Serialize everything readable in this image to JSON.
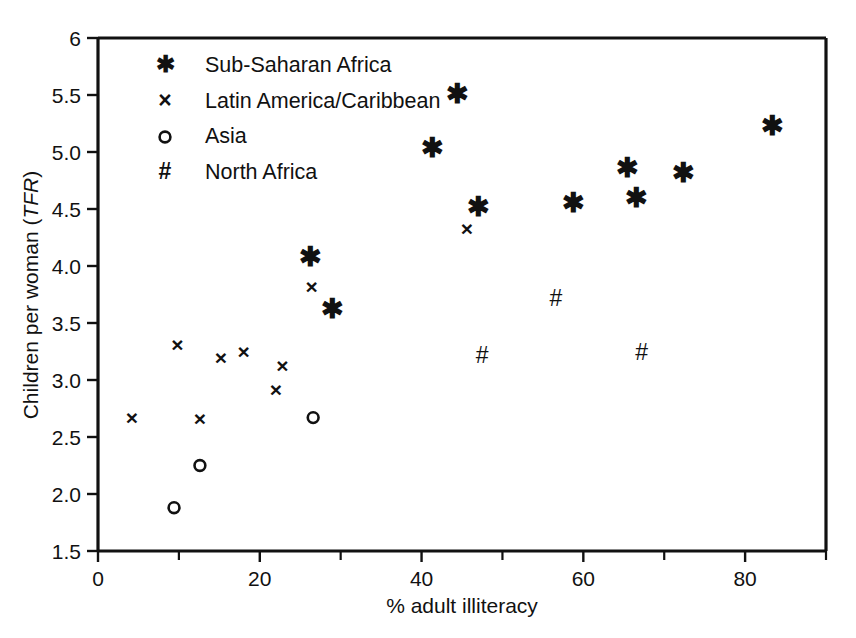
{
  "chart_data": {
    "type": "scatter",
    "title": "",
    "xlabel": "% adult illiteracy",
    "ylabel": "Children per woman (TFR)",
    "ylabel_plain": "Children per woman (",
    "ylabel_italic": "TFR",
    "ylabel_tail": ")",
    "xlim": [
      0,
      90
    ],
    "ylim": [
      1.5,
      6
    ],
    "grid": false,
    "legend_position": "top-left inside axes",
    "xticks": [
      0,
      20,
      40,
      60,
      80
    ],
    "xticklabels": [
      "0",
      "20",
      "40",
      "60",
      "80"
    ],
    "xticks_minor": [
      10,
      30,
      50,
      70,
      90
    ],
    "yticks": [
      1.5,
      2.0,
      2.5,
      3.0,
      3.5,
      4.0,
      4.5,
      5.0,
      5.5,
      6
    ],
    "yticklabels": [
      "1.5",
      "2.0",
      "2.5",
      "3.0",
      "3.5",
      "4.0",
      "4.5",
      "5.0",
      "5.5",
      "6"
    ],
    "series": [
      {
        "name": "Sub-Saharan Africa",
        "marker": "asterisk",
        "glyph": "✱",
        "points": [
          {
            "x": 26.3,
            "y": 4.08
          },
          {
            "x": 29.0,
            "y": 3.63
          },
          {
            "x": 41.3,
            "y": 5.04
          },
          {
            "x": 44.4,
            "y": 5.51
          },
          {
            "x": 47.0,
            "y": 4.52
          },
          {
            "x": 58.8,
            "y": 4.56
          },
          {
            "x": 65.4,
            "y": 4.86
          },
          {
            "x": 66.6,
            "y": 4.6
          },
          {
            "x": 72.4,
            "y": 4.82
          },
          {
            "x": 83.4,
            "y": 5.23
          }
        ]
      },
      {
        "name": "Latin America/Caribbean",
        "marker": "x",
        "glyph": "×",
        "points": [
          {
            "x": 4.2,
            "y": 2.67
          },
          {
            "x": 9.8,
            "y": 3.31
          },
          {
            "x": 12.6,
            "y": 2.66
          },
          {
            "x": 15.2,
            "y": 3.2
          },
          {
            "x": 18.0,
            "y": 3.25
          },
          {
            "x": 22.0,
            "y": 2.92
          },
          {
            "x": 22.8,
            "y": 3.13
          },
          {
            "x": 26.4,
            "y": 3.82
          },
          {
            "x": 45.6,
            "y": 4.33
          }
        ]
      },
      {
        "name": "Asia",
        "marker": "circle",
        "glyph": "○",
        "points": [
          {
            "x": 9.4,
            "y": 1.88
          },
          {
            "x": 12.6,
            "y": 2.25
          },
          {
            "x": 26.6,
            "y": 2.67
          }
        ]
      },
      {
        "name": "North Africa",
        "marker": "hash",
        "glyph": "#",
        "points": [
          {
            "x": 47.5,
            "y": 3.22
          },
          {
            "x": 56.6,
            "y": 3.72
          },
          {
            "x": 67.2,
            "y": 3.25
          }
        ]
      }
    ]
  },
  "legend": {
    "entries": [
      {
        "glyph": "✱",
        "label": "Sub-Saharan Africa"
      },
      {
        "glyph": "×",
        "label": "Latin America/Caribbean"
      },
      {
        "glyph": "○",
        "label": "Asia"
      },
      {
        "glyph": "#",
        "label": "North Africa"
      }
    ]
  },
  "colors": {
    "ink": "#111111",
    "background": "#ffffff"
  }
}
